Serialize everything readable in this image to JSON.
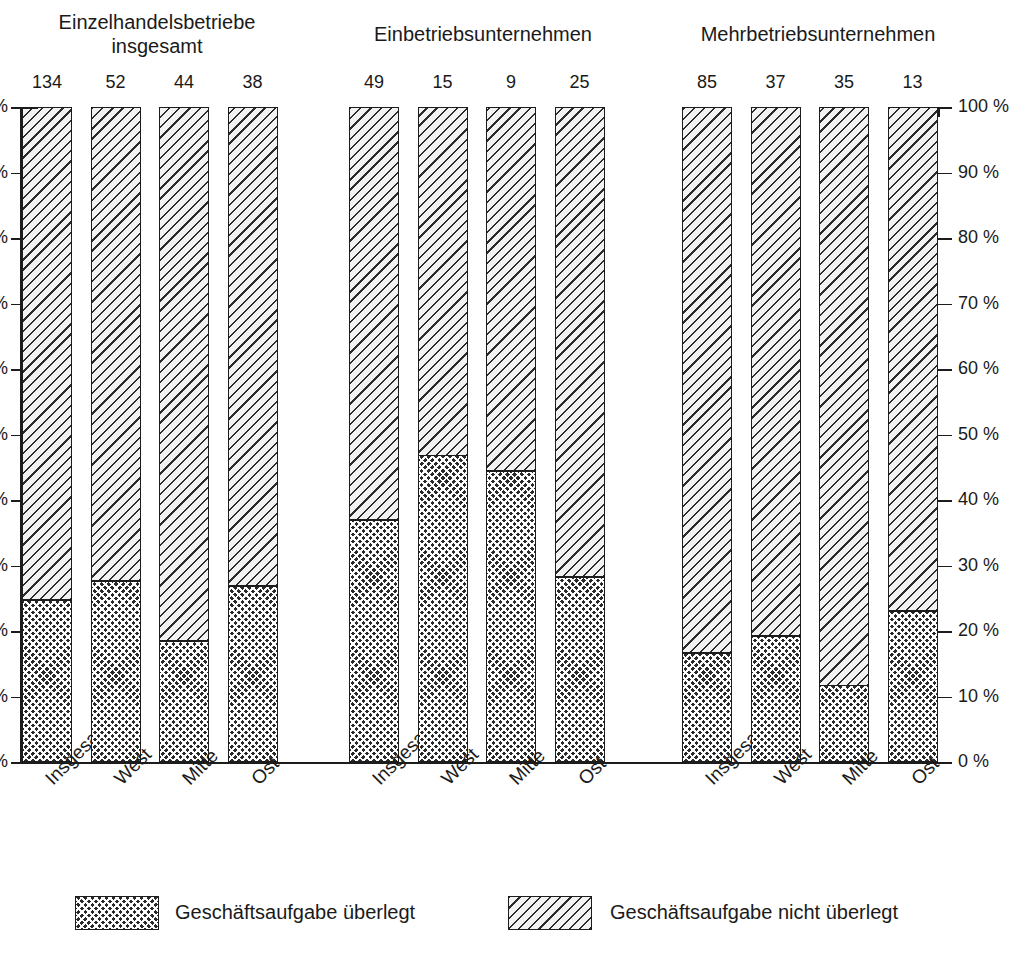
{
  "chart_data": {
    "type": "bar",
    "subtype": "stacked-percentage",
    "title": "",
    "xlabel": "",
    "ylabel": "",
    "ylim": [
      0,
      100
    ],
    "grid": false,
    "legend_position": "bottom",
    "y_unit": "%",
    "y_ticks": [
      "0 %",
      "10 %",
      "20 %",
      "30 %",
      "40 %",
      "50 %",
      "60 %",
      "70 %",
      "80 %",
      "90 %",
      "100 %"
    ],
    "y_tick_values": [
      0,
      10,
      20,
      30,
      40,
      50,
      60,
      70,
      80,
      90,
      100
    ],
    "left_axis_ticks": [
      "%",
      "%",
      "%",
      "%",
      "%",
      "%",
      "%",
      "%",
      "%",
      "%",
      "%"
    ],
    "legend": [
      {
        "label": "Geschäftsaufgabe überlegt",
        "pattern": "dark-checker",
        "color": "#2a2a2a"
      },
      {
        "label": "Geschäftsaufgabe nicht überlegt",
        "pattern": "light-diagonal-hatch",
        "color": "#f2f2f2"
      }
    ],
    "series": [
      {
        "name": "Geschäftsaufgabe überlegt",
        "values": [
          24.9,
          27.8,
          18.6,
          27.0,
          37.1,
          46.9,
          44.6,
          28.4,
          16.8,
          19.4,
          11.8,
          23.2
        ]
      },
      {
        "name": "Geschäftsaufgabe nicht überlegt",
        "values": [
          75.1,
          72.2,
          81.4,
          73.0,
          62.9,
          53.1,
          55.4,
          71.6,
          83.2,
          80.6,
          88.2,
          76.8
        ]
      }
    ],
    "groups": [
      {
        "title": "Einzelhandelsbetriebe\ninsgesamt",
        "title_line1": "Einzelhandelsbetriebe",
        "title_line2": "insgesamt",
        "bars": [
          {
            "category": "Insgesamt",
            "count": "134",
            "dark_pct": 24.9,
            "light_pct": 75.1
          },
          {
            "category": "West",
            "count": "52",
            "dark_pct": 27.8,
            "light_pct": 72.2
          },
          {
            "category": "Mitte",
            "count": "44",
            "dark_pct": 18.6,
            "light_pct": 81.4
          },
          {
            "category": "Ost",
            "count": "38",
            "dark_pct": 27.0,
            "light_pct": 73.0
          }
        ]
      },
      {
        "title": "Einbetriebsunternehmen",
        "title_line1": "Einbetriebsunternehmen",
        "title_line2": "",
        "bars": [
          {
            "category": "Insgesamt",
            "count": "49",
            "dark_pct": 37.1,
            "light_pct": 62.9
          },
          {
            "category": "West",
            "count": "15",
            "dark_pct": 46.9,
            "light_pct": 53.1
          },
          {
            "category": "Mitte",
            "count": "9",
            "dark_pct": 44.6,
            "light_pct": 55.4
          },
          {
            "category": "Ost",
            "count": "25",
            "dark_pct": 28.4,
            "light_pct": 71.6
          }
        ]
      },
      {
        "title": "Mehrbetriebsunternehmen",
        "title_line1": "Mehrbetriebsunternehmen",
        "title_line2": "",
        "bars": [
          {
            "category": "Insgesamt",
            "count": "85",
            "dark_pct": 16.8,
            "light_pct": 83.2
          },
          {
            "category": "West",
            "count": "37",
            "dark_pct": 19.4,
            "light_pct": 80.6
          },
          {
            "category": "Mitte",
            "count": "35",
            "dark_pct": 11.8,
            "light_pct": 88.2
          },
          {
            "category": "Ost",
            "count": "13",
            "dark_pct": 23.2,
            "light_pct": 76.8
          }
        ]
      }
    ]
  }
}
